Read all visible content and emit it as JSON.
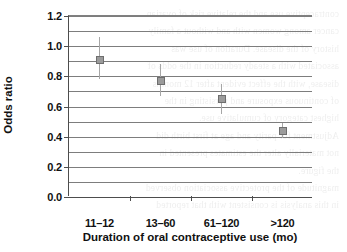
{
  "chart_data": {
    "type": "scatter",
    "title": "",
    "xlabel": "Duration of oral contraceptive use (mo)",
    "ylabel": "Odds ratio",
    "categories": [
      "11–12",
      "13–60",
      "61–120",
      ">120"
    ],
    "values": [
      0.91,
      0.77,
      0.65,
      0.44
    ],
    "error_low": [
      0.78,
      0.67,
      0.55,
      0.39
    ],
    "error_high": [
      1.06,
      0.88,
      0.75,
      0.49
    ],
    "series": [
      {
        "name": "Odds ratio",
        "values": [
          0.91,
          0.77,
          0.65,
          0.44
        ]
      }
    ],
    "ylim": [
      0.0,
      1.2
    ],
    "ytick_labels": [
      "0.0",
      "0.2",
      "0.4",
      "0.6",
      "0.8",
      "1.0",
      "1.2"
    ],
    "ytick_values": [
      0.0,
      0.2,
      0.4,
      0.6,
      0.8,
      1.0,
      1.2
    ],
    "gridline_values": [
      0.0,
      0.1,
      0.2,
      0.3,
      0.4,
      0.5,
      0.6,
      0.7,
      0.8,
      0.9,
      1.0,
      1.1,
      1.2
    ],
    "grid": true,
    "legend": "none",
    "marker_color": "#9b9b9b",
    "marker_edge_color": "#6e6e6e",
    "error_bar_color": "#a6a6a6",
    "gridline_color": "#7d7d7d",
    "axis_color": "#4d4d4d"
  },
  "background_text": {
    "lines": [
      "contraceptive use and the relative risk of ovarian",
      "cancer among women with and without a family",
      "history of the disease. Duration of use was",
      "",
      "associated with a steady reduction in the odds of",
      "disease, with the effect evident after 12 months",
      "of continuous exposure and persisting in the",
      "highest category of cumulative use.",
      "",
      "Adjustment for parity and age at first birth did",
      "not materially alter the estimates presented in",
      "the figure.",
      "",
      "magnitude of the protective association observed",
      "in this analysis is consistent with that reported"
    ]
  }
}
